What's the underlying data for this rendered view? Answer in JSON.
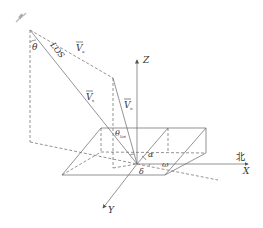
{
  "diagram": {
    "labels": {
      "theta": "θ",
      "los": "LOS",
      "v_top": "V",
      "v_top_sub": "u",
      "v_los": "V",
      "v_los_sub": "s",
      "v_vertical": "V",
      "v_vertical_sub": "n",
      "z_axis": "Z",
      "x_axis": "X",
      "y_axis": "Y",
      "north": "北",
      "theta_los": "θ",
      "theta_los_sub": "los",
      "alpha": "α",
      "omega": "ω",
      "delta": "δ"
    },
    "colors": {
      "line": "#666666",
      "text": "#333333",
      "satellite": "#999999"
    }
  }
}
